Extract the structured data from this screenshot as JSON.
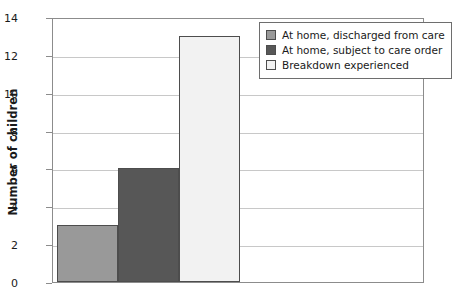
{
  "chart_data": {
    "type": "bar",
    "title": "",
    "xlabel": "",
    "ylabel": "Number of children",
    "categories": [
      "At home, discharged from care",
      "At home, subject to care order",
      "Breakdown experienced"
    ],
    "values": [
      3,
      6,
      13
    ],
    "ylim": [
      0,
      14
    ],
    "ytick_step": 2,
    "yticks": [
      0,
      2,
      4,
      6,
      8,
      10,
      12,
      14
    ],
    "ytick_labels": [
      "0",
      "2",
      "4",
      "6",
      "8",
      "10",
      "12",
      "14"
    ],
    "xtick_labels": [],
    "grid": true,
    "grid_axis": "y",
    "legend_position": "top-right",
    "legend": [
      {
        "label": "At home, discharged from care",
        "color": "#999999"
      },
      {
        "label": "At home, subject to care order",
        "color": "#575757"
      },
      {
        "label": "Breakdown experienced",
        "color": "#f2f2f2"
      }
    ],
    "series": [
      {
        "name": "Number of children",
        "values": [
          3,
          6,
          13
        ],
        "colors": [
          "#999999",
          "#575757",
          "#f2f2f2"
        ]
      }
    ]
  },
  "colors": {
    "bar_discharged": "#999999",
    "bar_care_order": "#575757",
    "bar_breakdown": "#f2f2f2",
    "bar_outline": "#4d4d4d",
    "axis": "#8c8c8c",
    "gridline": "#c8c8c8",
    "text": "#1a1a1a",
    "background": "#ffffff"
  }
}
